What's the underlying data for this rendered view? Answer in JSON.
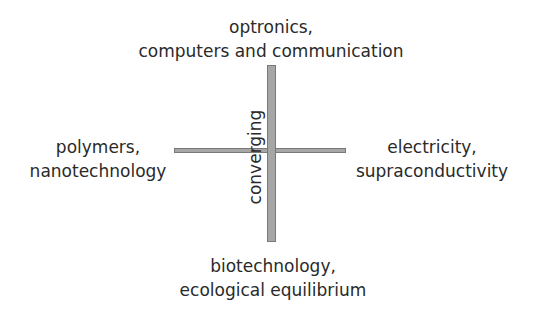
{
  "diagram": {
    "center_label": "converging",
    "top": {
      "lines": [
        "optronics,",
        "computers and communication"
      ]
    },
    "left": {
      "lines": [
        "polymers,",
        "nanotechnology"
      ]
    },
    "right": {
      "lines": [
        "electricity,",
        "supraconductivity"
      ]
    },
    "bottom": {
      "lines": [
        "biotechnology,",
        "ecological equilibrium"
      ]
    },
    "colors": {
      "bar_fill": "#a6a6a6",
      "bar_border": "#7a7a7a",
      "text": "#2a2a2a"
    }
  }
}
